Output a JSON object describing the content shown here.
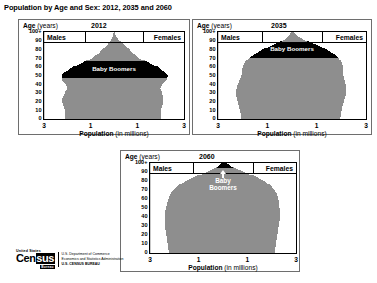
{
  "figure": {
    "title": "Population by Age and Sex: 2012, 2035 and 2060"
  },
  "common": {
    "age_axis_title": "Age",
    "age_axis_unit": "(years)",
    "x_axis_title": "Population",
    "x_axis_unit": "(in millions)",
    "males_label": "Males",
    "females_label": "Females",
    "y_ticks": [
      "100+",
      "90",
      "80",
      "70",
      "60",
      "50",
      "40",
      "30",
      "20",
      "10",
      "0"
    ],
    "x_ticks": [
      "3",
      "1",
      "1",
      "3"
    ],
    "boomer_label": "Baby Boomers",
    "boomer_label_line1": "Baby",
    "boomer_label_line2": "Boomers"
  },
  "colors": {
    "bar_gray": "#8e8e8e",
    "boomer_black": "#000000",
    "panel_border": "#6e6e6e",
    "plot_border": "#000000",
    "centerline": "#c9c9c9",
    "background": "#ffffff"
  },
  "footer": {
    "logo_us": "United States",
    "logo_census": "Census",
    "logo_bureau": "Bureau",
    "line1": "U.S. Department of Commerce",
    "line2": "Economics and Statistics Administration",
    "line3": "U.S. CENSUS BUREAU"
  },
  "panels": [
    {
      "id": "panel-2012",
      "year": "2012"
    },
    {
      "id": "panel-2035",
      "year": "2035"
    },
    {
      "id": "panel-2060",
      "year": "2060"
    }
  ],
  "chart_data": {
    "type": "bar",
    "subtype": "population-pyramid",
    "title": "Population by Age and Sex: 2012, 2035 and 2060",
    "xlabel": "Population (in millions)",
    "ylabel": "Age (years)",
    "xlim": [
      -3,
      3
    ],
    "ylim": [
      0,
      100
    ],
    "x_tick_values": [
      -3,
      -1,
      1,
      3
    ],
    "x_tick_labels": [
      "3",
      "1",
      "1",
      "3"
    ],
    "y_tick_values": [
      0,
      10,
      20,
      30,
      40,
      50,
      60,
      70,
      80,
      90,
      100
    ],
    "y_tick_labels": [
      "0",
      "10",
      "20",
      "30",
      "40",
      "50",
      "60",
      "70",
      "80",
      "90",
      "100+"
    ],
    "grid": false,
    "legend_position": "inside-top",
    "legend_entries": [
      "Males",
      "Females"
    ],
    "annotations": [
      "Baby Boomers"
    ],
    "units": "millions of people per single year of age",
    "panels": [
      {
        "year": "2012",
        "boomer_age_range": [
          48,
          66
        ],
        "ages": [
          0,
          5,
          10,
          15,
          20,
          25,
          30,
          35,
          40,
          45,
          50,
          55,
          60,
          65,
          70,
          75,
          80,
          85,
          90,
          95,
          100
        ],
        "males": [
          2.1,
          2.1,
          2.1,
          2.17,
          2.22,
          2.2,
          2.1,
          2.0,
          2.05,
          2.25,
          2.25,
          2.05,
          1.75,
          1.35,
          0.95,
          0.7,
          0.5,
          0.3,
          0.15,
          0.05,
          0.02
        ],
        "females": [
          2.0,
          2.0,
          2.0,
          2.07,
          2.12,
          2.12,
          2.05,
          1.98,
          2.05,
          2.27,
          2.3,
          2.13,
          1.87,
          1.48,
          1.08,
          0.85,
          0.67,
          0.45,
          0.25,
          0.1,
          0.04
        ]
      },
      {
        "year": "2035",
        "boomer_age_range": [
          71,
          89
        ],
        "ages": [
          0,
          5,
          10,
          15,
          20,
          25,
          30,
          35,
          40,
          45,
          50,
          55,
          60,
          65,
          70,
          75,
          80,
          85,
          90,
          95,
          100
        ],
        "males": [
          2.05,
          2.08,
          2.12,
          2.15,
          2.2,
          2.25,
          2.28,
          2.25,
          2.2,
          2.12,
          2.05,
          2.02,
          2.0,
          1.92,
          1.75,
          1.5,
          1.2,
          0.8,
          0.4,
          0.15,
          0.05
        ],
        "females": [
          1.95,
          1.98,
          2.02,
          2.05,
          2.1,
          2.15,
          2.2,
          2.2,
          2.17,
          2.12,
          2.08,
          2.07,
          2.07,
          2.02,
          1.9,
          1.7,
          1.42,
          1.05,
          0.6,
          0.25,
          0.09
        ]
      },
      {
        "year": "2060",
        "boomer_age_range": [
          96,
          100
        ],
        "ages": [
          0,
          5,
          10,
          15,
          20,
          25,
          30,
          35,
          40,
          45,
          50,
          55,
          60,
          65,
          70,
          75,
          80,
          85,
          90,
          95,
          100
        ],
        "males": [
          2.22,
          2.25,
          2.28,
          2.3,
          2.33,
          2.36,
          2.38,
          2.4,
          2.4,
          2.38,
          2.35,
          2.3,
          2.25,
          2.18,
          2.05,
          1.85,
          1.55,
          1.15,
          0.7,
          0.3,
          0.1
        ],
        "females": [
          2.12,
          2.15,
          2.18,
          2.2,
          2.23,
          2.26,
          2.29,
          2.32,
          2.33,
          2.33,
          2.32,
          2.3,
          2.27,
          2.22,
          2.12,
          1.97,
          1.72,
          1.35,
          0.9,
          0.45,
          0.18
        ]
      }
    ]
  }
}
